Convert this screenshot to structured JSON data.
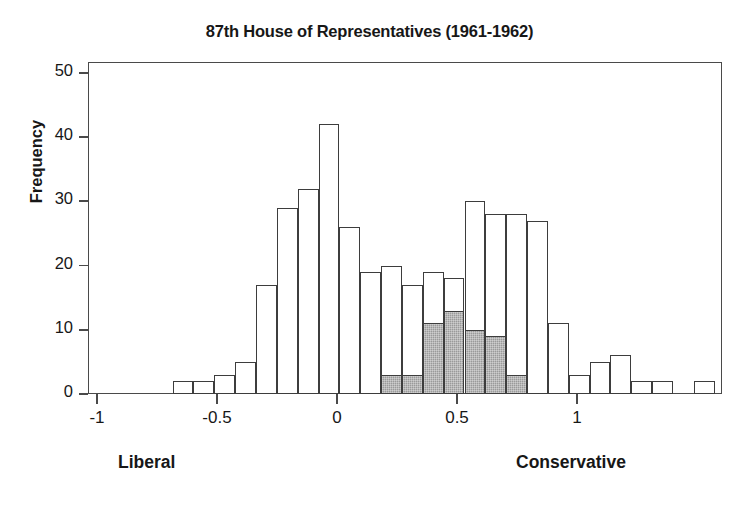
{
  "chart_data": {
    "type": "bar",
    "subtype": "stacked-histogram",
    "title": "87th House of Representatives (1961-1962)",
    "xlabel": "",
    "ylabel": "Frequency",
    "xlim": [
      -1,
      1
    ],
    "ylim": [
      0,
      50
    ],
    "grid": false,
    "legend": "none",
    "x_tick_labels": [
      "-1",
      "-0.5",
      "0",
      "0.5",
      "1"
    ],
    "x_tick_values": [
      -1,
      -0.5,
      0,
      0.5,
      1
    ],
    "y_tick_labels": [
      "0",
      "10",
      "20",
      "30",
      "40",
      "50"
    ],
    "y_tick_values": [
      0,
      10,
      20,
      30,
      40,
      50
    ],
    "axis_annotations": {
      "left": "Liberal",
      "right": "Conservative"
    },
    "bin_width": 0.0866,
    "series": [
      {
        "name": "unshaded",
        "fill": "#ffffff",
        "values": [
          2,
          2,
          3,
          5,
          17,
          29,
          32,
          42,
          26,
          19,
          17,
          19,
          8,
          5,
          30,
          28,
          28,
          27,
          11,
          3,
          5,
          6,
          2,
          2,
          0,
          2
        ]
      },
      {
        "name": "shaded",
        "fill": "#9a9a9a",
        "values": [
          0,
          0,
          0,
          0,
          0,
          0,
          0,
          0,
          0,
          0,
          3,
          3,
          11,
          13,
          10,
          9,
          3,
          0,
          0,
          0,
          0,
          0,
          0,
          0,
          0,
          0
        ]
      }
    ],
    "bin_left_edges": [
      -0.78,
      -0.693,
      -0.606,
      -0.52,
      -0.433,
      -0.346,
      -0.26,
      -0.173,
      -0.087,
      0.0,
      -0.13,
      -0.043,
      0.043,
      0.13,
      0.216,
      0.303,
      0.39,
      0.476,
      0.563,
      0.65,
      0.736,
      0.823,
      0.91
    ],
    "bar_totals": [
      2,
      2,
      3,
      5,
      17,
      29,
      32,
      42,
      26,
      19,
      20,
      17,
      19,
      18,
      30,
      28,
      28,
      27,
      11,
      3,
      5,
      6,
      2,
      2,
      0,
      2
    ]
  },
  "bars": [
    {
      "name": "bar-1",
      "x0": -0.78,
      "total": 2,
      "shaded": 0
    },
    {
      "name": "bar-2",
      "x0": -0.693,
      "total": 2,
      "shaded": 0
    },
    {
      "name": "bar-3",
      "x0": -0.606,
      "total": 3,
      "shaded": 0
    },
    {
      "name": "bar-4",
      "x0": -0.52,
      "total": 5,
      "shaded": 0
    },
    {
      "name": "bar-5",
      "x0": -0.433,
      "total": 17,
      "shaded": 0
    },
    {
      "name": "bar-6",
      "x0": -0.346,
      "total": 29,
      "shaded": 0
    },
    {
      "name": "bar-7",
      "x0": -0.26,
      "total": 32,
      "shaded": 0
    },
    {
      "name": "bar-8",
      "x0": -0.173,
      "total": 42,
      "shaded": 0
    },
    {
      "name": "bar-9",
      "x0": -0.087,
      "total": 26,
      "shaded": 0
    },
    {
      "name": "bar-10",
      "x0": 0.0,
      "total": 19,
      "shaded": 0
    },
    {
      "name": "bar-11",
      "x0": 0.087,
      "total": 20,
      "shaded": 3
    },
    {
      "name": "bar-12",
      "x0": 0.173,
      "total": 17,
      "shaded": 3
    },
    {
      "name": "bar-13",
      "x0": 0.26,
      "total": 19,
      "shaded": 11
    },
    {
      "name": "bar-14",
      "x0": 0.346,
      "total": 18,
      "shaded": 13
    },
    {
      "name": "bar-15",
      "x0": 0.433,
      "total": 30,
      "shaded": 10
    },
    {
      "name": "bar-16",
      "x0": 0.52,
      "total": 28,
      "shaded": 9
    },
    {
      "name": "bar-17",
      "x0": 0.606,
      "total": 28,
      "shaded": 3
    },
    {
      "name": "bar-18",
      "x0": 0.693,
      "total": 27,
      "shaded": 0
    },
    {
      "name": "bar-19",
      "x0": 0.78,
      "total": 11,
      "shaded": 0
    },
    {
      "name": "bar-20",
      "x0": 0.866,
      "total": 3,
      "shaded": 0
    },
    {
      "name": "bar-21",
      "x0": 0.953,
      "total": 5,
      "shaded": 0
    },
    {
      "name": "bar-22",
      "x0": 1.04,
      "total": 6,
      "shaded": 0
    },
    {
      "name": "bar-23",
      "x0": 1.126,
      "total": 2,
      "shaded": 0
    },
    {
      "name": "bar-24",
      "x0": 1.213,
      "total": 2,
      "shaded": 0
    },
    {
      "name": "bar-25",
      "x0": 1.386,
      "total": 2,
      "shaded": 0
    }
  ],
  "axes": {
    "y_label": "Frequency",
    "y_ticks": [
      {
        "value": 50,
        "label": "50"
      },
      {
        "value": 40,
        "label": "40"
      },
      {
        "value": 30,
        "label": "30"
      },
      {
        "value": 20,
        "label": "20"
      },
      {
        "value": 10,
        "label": "10"
      },
      {
        "value": 0,
        "label": "0"
      }
    ],
    "x_ticks": [
      {
        "value": -1,
        "label": "-1"
      },
      {
        "value": -0.5,
        "label": "-0.5"
      },
      {
        "value": 0,
        "label": "0"
      },
      {
        "value": 0.5,
        "label": "0.5"
      },
      {
        "value": 1,
        "label": "1"
      }
    ],
    "x_annotation_left": "Liberal",
    "x_annotation_right": "Conservative"
  },
  "title": "87th House of Representatives (1961-1962)",
  "colors": {
    "frame": "#4a4a4a",
    "bar_outline": "#3d3d3d",
    "bar_fill": "#ffffff",
    "bar_shaded_fill": "#9a9a9a",
    "text": "#171717",
    "background": "#ffffff"
  }
}
